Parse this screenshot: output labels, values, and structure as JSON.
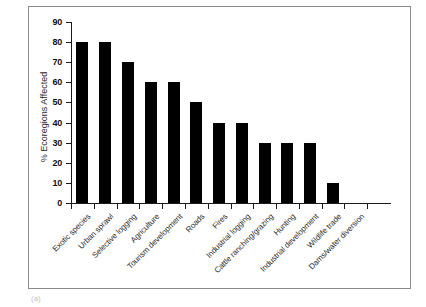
{
  "figure": {
    "caption": "(a)",
    "background_color": "#ffffff",
    "frame_color": "#8a8a8a",
    "bar_color": "#000000",
    "axis_color": "#1a1a1a"
  },
  "chart_data": {
    "type": "bar",
    "title": "",
    "xlabel": "",
    "ylabel": "% Ecoregions Affected",
    "ylim": [
      0,
      90
    ],
    "ytick_step": 10,
    "yticks": [
      0,
      10,
      20,
      30,
      40,
      50,
      60,
      70,
      80,
      90
    ],
    "grid": false,
    "legend": false,
    "categories": [
      "Exotic species",
      "Urban sprawl",
      "Selective logging",
      "Agriculture",
      "Tourism development",
      "Roads",
      "Fires",
      "Industrial logging",
      "Cattle ranching/grazing",
      "Hunting",
      "Industrial development",
      "Wildlife trade",
      "Dams/water diversion"
    ],
    "values": [
      80,
      80,
      70,
      60,
      60,
      50,
      40,
      40,
      30,
      30,
      30,
      10,
      0
    ]
  }
}
